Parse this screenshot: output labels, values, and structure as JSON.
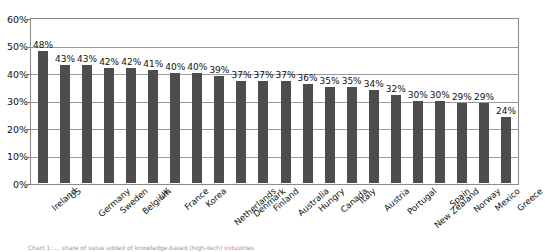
{
  "chart_data": {
    "type": "bar",
    "title": "",
    "xlabel": "",
    "ylabel": "",
    "ylim": [
      0,
      60
    ],
    "ytick_labels": [
      "60%",
      "50%",
      "40%",
      "30%",
      "20%",
      "10%",
      "0%"
    ],
    "ytick_values": [
      60,
      50,
      40,
      30,
      20,
      10,
      0
    ],
    "ytick_step": 10,
    "grid": true,
    "legend": "none",
    "value_label_suffix": "%",
    "bar_color": "#4d4d4d",
    "plot_border_color": "#8a8a8a",
    "gridline_color": "#9b9b9b",
    "categories": [
      "Ireland",
      "US",
      "Germany",
      "Sweden",
      "Belgium",
      "UK",
      "France",
      "Korea",
      "Netherlands",
      "Denmark",
      "Finland",
      "Australia",
      "Hungry",
      "Canada",
      "Italy",
      "Austria",
      "Portugal",
      "New Zealand",
      "Spain",
      "Norway",
      "Mexico",
      "Greece"
    ],
    "values": [
      48,
      43,
      43,
      42,
      42,
      41,
      40,
      40,
      39,
      37,
      37,
      37,
      36,
      35,
      35,
      34,
      32,
      30,
      30,
      29,
      29,
      24
    ],
    "value_labels": [
      "48%",
      "43%",
      "43%",
      "42%",
      "42%",
      "41%",
      "40%",
      "40%",
      "39%",
      "37%",
      "37%",
      "37%",
      "36%",
      "35%",
      "35%",
      "34%",
      "32%",
      "30%",
      "30%",
      "29%",
      "29%",
      "24%"
    ]
  },
  "caption": {
    "text": "Chart 1: ... share of value added of knowledge-based (high-tech) industries"
  }
}
